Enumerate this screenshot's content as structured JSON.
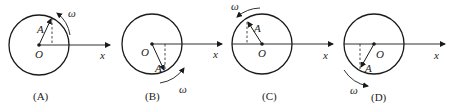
{
  "figure": {
    "panels": [
      {
        "caption": "(A)",
        "center": [
          39,
          45
        ],
        "radius": 30,
        "vector_tip": [
          52,
          17
        ],
        "origin_label": "O",
        "amplitude_label": "A",
        "omega_label": "ω",
        "axis_label": "x",
        "rotation": "counterclockwise",
        "omega_pos": [
          72,
          17
        ],
        "arc_pos": "upper-right",
        "axis_end": 110
      },
      {
        "caption": "(B)",
        "center": [
          152,
          44
        ],
        "radius": 30,
        "vector_tip": [
          165,
          72
        ],
        "origin_label": "O",
        "amplitude_label": "A",
        "omega_label": "ω",
        "axis_label": "x",
        "rotation": "counterclockwise",
        "omega_pos": [
          180,
          92
        ],
        "arc_pos": "lower-right",
        "axis_end": 222
      },
      {
        "caption": "(C)",
        "center": [
          262,
          44
        ],
        "radius": 30,
        "vector_tip": [
          247,
          21
        ],
        "origin_label": "O",
        "amplitude_label": "A",
        "omega_label": "ω",
        "axis_label": "x",
        "rotation": "counterclockwise",
        "omega_pos": [
          232,
          10
        ],
        "arc_pos": "upper-left",
        "axis_end": 333
      },
      {
        "caption": "(D)",
        "center": [
          374,
          44
        ],
        "radius": 30,
        "vector_tip": [
          360,
          69
        ],
        "origin_label": "O",
        "amplitude_label": "A",
        "omega_label": "ω",
        "axis_label": "x",
        "rotation": "counterclockwise",
        "omega_pos": [
          349,
          93
        ],
        "arc_pos": "lower-left",
        "axis_end": 445
      }
    ]
  },
  "captions": [
    "(A)",
    "(B)",
    "(C)",
    "(D)"
  ],
  "colors": {
    "stroke": "#1a1a1a",
    "background": "#ffffff"
  }
}
